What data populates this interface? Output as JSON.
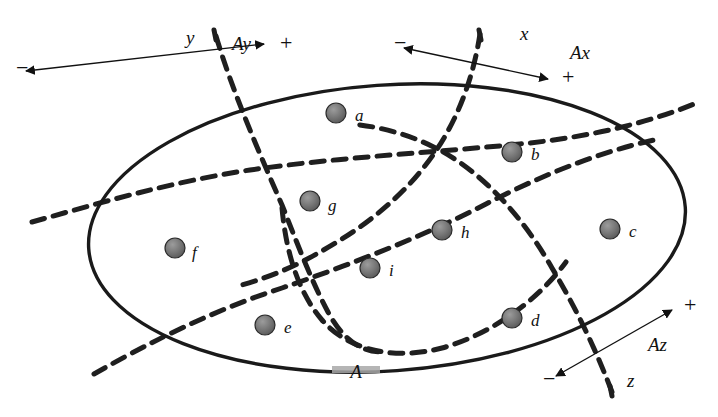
{
  "figure": {
    "outer_region": {
      "label": "A",
      "shape": "ellipse",
      "cx": 387,
      "cy": 228,
      "rx": 299,
      "ry": 143,
      "rotation_deg": -4,
      "stroke": "#1a1a1a",
      "stroke_width": 3.4,
      "label_x": 356,
      "label_y": 378,
      "label_highlight": "#9a9a9a"
    },
    "nodes": [
      {
        "id": "a",
        "label": "a",
        "cx": 336,
        "cy": 113,
        "r": 10,
        "label_x": 355,
        "label_y": 121
      },
      {
        "id": "b",
        "label": "b",
        "cx": 512,
        "cy": 152,
        "r": 10,
        "label_x": 531,
        "label_y": 160
      },
      {
        "id": "c",
        "label": "c",
        "cx": 610,
        "cy": 229,
        "r": 10,
        "label_x": 629,
        "label_y": 237
      },
      {
        "id": "d",
        "label": "d",
        "cx": 512,
        "cy": 318,
        "r": 10,
        "label_x": 531,
        "label_y": 326
      },
      {
        "id": "e",
        "label": "e",
        "cx": 265,
        "cy": 325,
        "r": 10,
        "label_x": 284,
        "label_y": 333
      },
      {
        "id": "f",
        "label": "f",
        "cx": 175,
        "cy": 248,
        "r": 10,
        "label_x": 192,
        "label_y": 258
      },
      {
        "id": "g",
        "label": "g",
        "cx": 310,
        "cy": 201,
        "r": 10,
        "label_x": 328,
        "label_y": 211
      },
      {
        "id": "h",
        "label": "h",
        "cx": 442,
        "cy": 230,
        "r": 10,
        "label_x": 461,
        "label_y": 238
      },
      {
        "id": "i",
        "label": "i",
        "cx": 370,
        "cy": 268,
        "r": 10,
        "label_x": 389,
        "label_y": 276
      }
    ],
    "node_fill": "#6e6e6e",
    "node_stroke": "#2b2b2b",
    "divider_stroke": "#1f1f1f",
    "divider_width": 5,
    "divider_dash": "13 9",
    "axes": [
      {
        "name": "y",
        "axis_letter": "y",
        "component_label": "Ay",
        "minus_label": "−",
        "plus_label": "+",
        "letter_x": 186,
        "letter_y": 44,
        "component_x": 232,
        "component_y": 50,
        "minus_x": 16,
        "minus_y": 75,
        "plus_x": 280,
        "plus_y": 50,
        "arrow_x1": 26,
        "arrow_y1": 71,
        "arrow_x2": 264,
        "arrow_y2": 44
      },
      {
        "name": "x",
        "axis_letter": "x",
        "component_label": "Ax",
        "minus_label": "−",
        "plus_label": "+",
        "letter_x": 520,
        "letter_y": 40,
        "component_x": 570,
        "component_y": 59,
        "minus_x": 394,
        "minus_y": 50,
        "plus_x": 562,
        "plus_y": 84,
        "arrow_x1": 548,
        "arrow_y1": 79,
        "arrow_x2": 404,
        "arrow_y2": 48
      },
      {
        "name": "z",
        "axis_letter": "z",
        "component_label": "Az",
        "minus_label": "−",
        "plus_label": "+",
        "letter_x": 627,
        "letter_y": 387,
        "component_x": 648,
        "component_y": 351,
        "minus_x": 543,
        "minus_y": 386,
        "plus_x": 684,
        "plus_y": 312,
        "arrow_x1": 556,
        "arrow_y1": 376,
        "arrow_x2": 672,
        "arrow_y2": 310
      }
    ],
    "axis_arrow_stroke": "#111111",
    "axis_arrow_width": 1.4
  }
}
